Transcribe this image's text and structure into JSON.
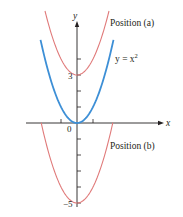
{
  "chart_data": {
    "type": "line",
    "title": "",
    "xlabel": "x",
    "ylabel": "y",
    "xlim": [
      -3.2,
      5.4
    ],
    "ylim": [
      -5.6,
      6.3
    ],
    "grid": false,
    "x_ticks": [
      -1,
      0,
      1
    ],
    "y_ticks": [
      -5,
      -4,
      -3,
      -2,
      -1,
      1,
      2,
      3,
      4
    ],
    "tick_labels": {
      "origin": "0",
      "y3": "3",
      "ym5": "−5"
    },
    "series": [
      {
        "name": "y = x^2",
        "label": "y = x²",
        "color": "#3d8fd6",
        "formula": "x^2",
        "x_range": [
          -2.28,
          2.28
        ],
        "points": [
          [
            -2,
            4
          ],
          [
            -1,
            1
          ],
          [
            0,
            0
          ],
          [
            1,
            1
          ],
          [
            2,
            4
          ]
        ]
      },
      {
        "name": "Position (a)",
        "label": "Position (a)",
        "color": "#e07a7a",
        "formula": "x^2 + 3",
        "x_range": [
          -2.0,
          2.0
        ],
        "points": [
          [
            -2,
            7
          ],
          [
            -1,
            4
          ],
          [
            0,
            3
          ],
          [
            1,
            4
          ],
          [
            2,
            7
          ]
        ]
      },
      {
        "name": "Position (b)",
        "label": "Position (b)",
        "color": "#e07a7a",
        "formula": "x^2 - 5",
        "x_range": [
          -2.24,
          2.24
        ],
        "points": [
          [
            -2.24,
            0
          ],
          [
            -1,
            -4
          ],
          [
            0,
            -5
          ],
          [
            1,
            -4
          ],
          [
            2.24,
            0
          ]
        ]
      }
    ],
    "annotations": [
      {
        "text": "Position (a)",
        "near": "upper-right of red curve y = x^2 + 3"
      },
      {
        "text": "y = x²",
        "near": "right of blue curve"
      },
      {
        "text": "Position (b)",
        "near": "right of red curve y = x^2 - 5, below x-axis"
      }
    ]
  },
  "labels": {
    "position_a": "Position (a)",
    "position_b": "Position (b)",
    "curve_eq_prefix": "y = x",
    "curve_eq_exp": "2",
    "x_axis": "x",
    "y_axis": "y",
    "origin": "0",
    "y_three": "3",
    "y_minus_five": "−5"
  }
}
